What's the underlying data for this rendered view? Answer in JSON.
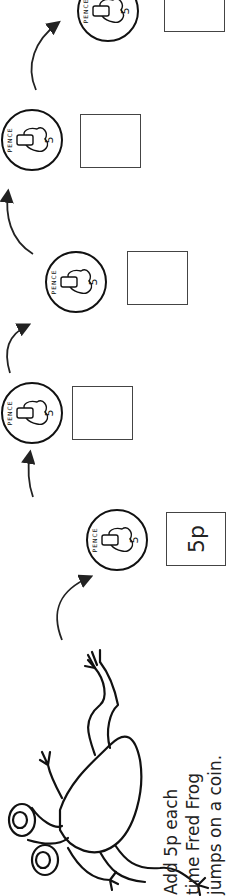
{
  "worksheet": {
    "orientation": "rotated-90-ccw",
    "instruction": {
      "line1": "Add 5p each",
      "line2": "time Fred Frog",
      "line3": "jumps on a coin."
    },
    "character": "frog",
    "coin": {
      "legend_top": "PENCE",
      "legend_bottom": "FIVE",
      "denomination": "5"
    },
    "boxes": [
      {
        "value": "5p"
      },
      {
        "value": ""
      },
      {
        "value": ""
      },
      {
        "value": ""
      },
      {
        "value": ""
      }
    ]
  }
}
